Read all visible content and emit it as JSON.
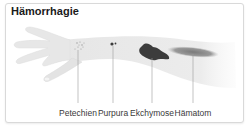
{
  "figure": {
    "title": "Hämorrhagie",
    "labels": [
      {
        "id": "petechien",
        "text": "Petechien",
        "x": 78
      },
      {
        "id": "purpura",
        "text": "Purpura",
        "x": 113
      },
      {
        "id": "ekchymose",
        "text": "Ekchymose",
        "x": 152
      },
      {
        "id": "haematom",
        "text": "Hämatom",
        "x": 193
      }
    ],
    "colors": {
      "skin": "#ebebeb",
      "lesion_dark": "#3c3c3c",
      "haematom": "#8a8a8a",
      "leader_line": "#9a9a9a",
      "border": "#d9d9d9"
    }
  }
}
